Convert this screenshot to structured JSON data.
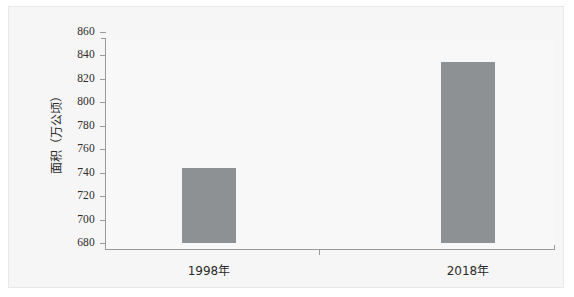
{
  "chart_data": {
    "type": "bar",
    "title": "",
    "xlabel": "",
    "ylabel": "面积（万公顷）",
    "categories": [
      "1998年",
      "2018年"
    ],
    "values": [
      744,
      834
    ],
    "series": [
      {
        "name": "面积",
        "values": [
          744,
          834
        ]
      }
    ],
    "ylim": [
      680,
      860
    ],
    "ytick_step": 20,
    "yticks": [
      860,
      840,
      820,
      800,
      780,
      760,
      740,
      720,
      700,
      680
    ],
    "ytick_labels": [
      "860",
      "840",
      "820",
      "800",
      "780",
      "760",
      "740",
      "720",
      "700",
      "680"
    ],
    "grid": false,
    "legend": null,
    "bar_color": "#8d9194",
    "axis_color": "#9a9a9a",
    "plot_background": "#f8f8f8",
    "panel_background": "#f6f6f6",
    "text_color": "#2b2b2b"
  }
}
